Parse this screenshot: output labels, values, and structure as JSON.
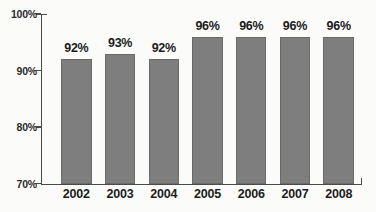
{
  "chart_data": {
    "type": "bar",
    "title": "",
    "subtitle": "",
    "xlabel": "",
    "ylabel": "",
    "categories": [
      "2002",
      "2003",
      "2004",
      "2005",
      "2006",
      "2007",
      "2008"
    ],
    "values": [
      92,
      93,
      92,
      96,
      96,
      96,
      96
    ],
    "value_labels": [
      "92%",
      "93%",
      "92%",
      "96%",
      "96%",
      "96%",
      "96%"
    ],
    "ylim": [
      70,
      100
    ],
    "yticks": [
      70,
      80,
      90,
      100
    ],
    "ytick_labels": [
      "70%",
      "80%",
      "90%",
      "100%"
    ],
    "grid": false,
    "legend": false,
    "legend_position": "none",
    "series": [
      {
        "name": "",
        "values": [
          92,
          93,
          92,
          96,
          96,
          96,
          96
        ]
      }
    ],
    "colors": {
      "bar_fill": "#7e7e7e",
      "bar_stroke": "#6a6a6a",
      "axis": "#4a4a4a",
      "text": "#1c1c1c",
      "background": "#fbfbfa"
    }
  }
}
